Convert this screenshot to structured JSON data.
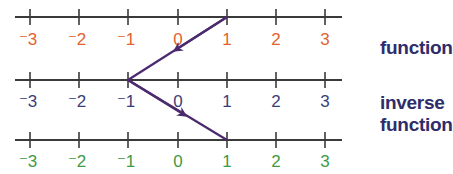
{
  "diagram": {
    "lines": [
      {
        "name": "top-number-line",
        "color": "#e0632f",
        "ticks": [
          "⁻3",
          "⁻2",
          "⁻1",
          "0",
          "1",
          "2",
          "3"
        ]
      },
      {
        "name": "middle-number-line",
        "color": "#3a3e78",
        "ticks": [
          "⁻3",
          "⁻2",
          "⁻1",
          "0",
          "1",
          "2",
          "3"
        ]
      },
      {
        "name": "bottom-number-line",
        "color": "#3f9a46",
        "ticks": [
          "⁻3",
          "⁻2",
          "⁻1",
          "0",
          "1",
          "2",
          "3"
        ]
      }
    ],
    "arrows": [
      {
        "name": "function-arrow",
        "from": "top 1",
        "to": "middle -1",
        "color": "#4b2a6e"
      },
      {
        "name": "inverse-function-arrow",
        "from": "middle -1",
        "to": "bottom 1",
        "color": "#4b2a6e"
      }
    ],
    "labels": {
      "function": "function",
      "inverse_line1": "inverse",
      "inverse_line2": "function"
    }
  }
}
